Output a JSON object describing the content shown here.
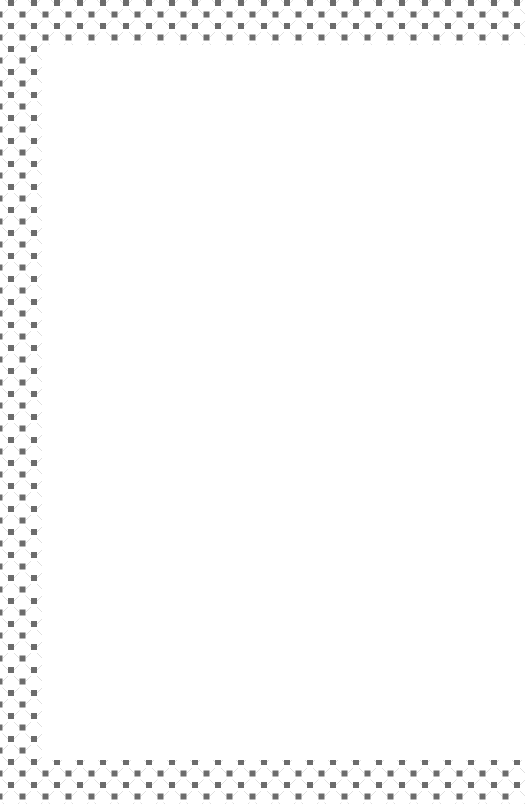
{
  "page": {
    "content_text": ""
  },
  "border": {
    "pattern": "octagon-lattice-with-dark-squares",
    "square_color": "#6c6c6c",
    "line_color": "#e0e0e0",
    "background_color": "#ffffff",
    "cell_size_px": 23,
    "square_size_px": 6,
    "sides": [
      "top",
      "left",
      "bottom"
    ]
  },
  "content_area": {
    "background_color": "#ffffff"
  }
}
